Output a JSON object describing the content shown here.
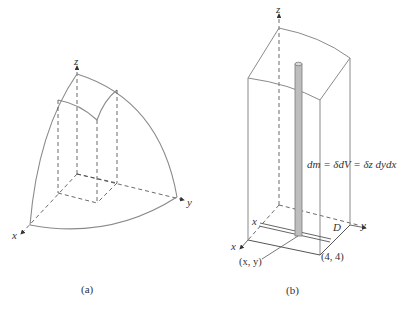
{
  "figure_a": {
    "caption": "(a)",
    "axes": {
      "x": "x",
      "y": "y",
      "z": "z"
    }
  },
  "figure_b": {
    "caption": "(b)",
    "axes": {
      "x": "x",
      "y": "y",
      "z": "z"
    },
    "mass_element_label": "dm = δdV = δz dydx",
    "region_label": "D",
    "strip_label": "x",
    "point_label": "(x, y)",
    "corner_label": "(4, 4)"
  },
  "colors": {
    "curve": "#8a8a8a",
    "dashed": "#444444",
    "column_fill": "#bdbdbd",
    "column_edge": "#7a7a7a"
  }
}
